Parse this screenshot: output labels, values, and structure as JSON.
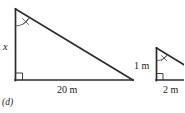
{
  "figure": {
    "part_label": "(d)",
    "large_triangle": {
      "name": "large right triangle",
      "vertical_leg_label": "x",
      "base_label": "20 m",
      "angle_mark": "x",
      "has_right_angle_mark": true,
      "apex": {
        "x": 15,
        "y": 9
      },
      "right_angle_vertex": {
        "x": 15,
        "y": 80
      },
      "far_vertex": {
        "x": 133,
        "y": 80
      }
    },
    "small_triangle": {
      "name": "small right triangle",
      "vertical_leg_label": "1 m",
      "base_label": "2 m",
      "angle_mark": "x",
      "has_right_angle_mark": true,
      "apex": {
        "x": 156,
        "y": 48
      },
      "right_angle_vertex": {
        "x": 156,
        "y": 80
      },
      "far_vertex": {
        "x": 190,
        "y": 80
      }
    },
    "colors": {
      "background": "#ffffff",
      "stroke": "#2b2b2b",
      "angle_mark": "#555555",
      "text": "#1a1a1a"
    },
    "stroke_width": 1.6,
    "thin_stroke_width": 0.9
  }
}
